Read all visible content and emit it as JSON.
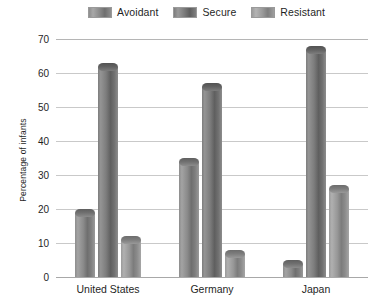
{
  "chart_data": {
    "type": "bar",
    "title": "",
    "subtitle": "",
    "xlabel": "",
    "ylabel": "Percentage of infants",
    "categories": [
      "United States",
      "Germany",
      "Japan"
    ],
    "series": [
      {
        "name": "Avoidant",
        "values": [
          20,
          35,
          5
        ],
        "color": "#8a8a8a"
      },
      {
        "name": "Secure",
        "values": [
          63,
          57,
          68
        ],
        "color": "#6f6f6f"
      },
      {
        "name": "Resistant",
        "values": [
          12,
          8,
          27
        ],
        "color": "#9c9c9c"
      }
    ],
    "ylim": [
      0,
      70
    ],
    "yticks": [
      0,
      10,
      20,
      30,
      40,
      50,
      60,
      70
    ],
    "ytick_labels": [
      "0",
      "10",
      "20",
      "30",
      "40",
      "50",
      "60",
      "70"
    ],
    "grid": true,
    "grid_axis": "y",
    "legend_position": "top",
    "bar_style": "3d-cylinder"
  },
  "legend": {
    "entries": [
      {
        "label": "Avoidant"
      },
      {
        "label": "Secure"
      },
      {
        "label": "Resistant"
      }
    ]
  },
  "axes": {
    "y_title": "Percentage of infants"
  },
  "colors": {
    "grid": "#c9c9c9",
    "axis": "#a8a8a8",
    "text": "#1f1f1f",
    "background": "#ffffff"
  }
}
